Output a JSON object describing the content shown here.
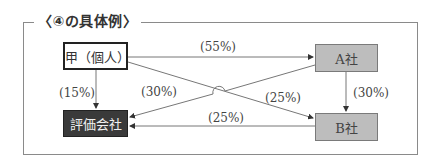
{
  "diagram": {
    "title": "〈④の具体例〉",
    "nodes": {
      "kou": {
        "label": "甲（個人）"
      },
      "a": {
        "label": "A社"
      },
      "b": {
        "label": "B社"
      },
      "eval": {
        "label": "評価会社"
      }
    },
    "edges": [
      {
        "from": "甲（個人）",
        "to": "A社",
        "label": "(55%)"
      },
      {
        "from": "甲（個人）",
        "to": "評価会社",
        "label": "(15%)"
      },
      {
        "from": "A社",
        "to": "評価会社",
        "label": "(30%)"
      },
      {
        "from": "甲（個人）",
        "to": "B社",
        "label": "(25%)"
      },
      {
        "from": "A社",
        "to": "B社",
        "label": "(30%)"
      },
      {
        "from": "B社",
        "to": "評価会社",
        "label": "(25%)"
      }
    ]
  }
}
